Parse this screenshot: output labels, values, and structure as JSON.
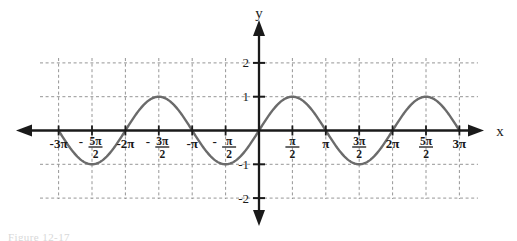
{
  "figure": {
    "caption": "Figure 12-17",
    "background_color": "#ffffff",
    "curve_color": "#6b6b6b",
    "axis_color": "#1a1a1a",
    "grid_color": "#8a8a8a"
  },
  "axes": {
    "x_axis_label": "x",
    "y_axis_label": "y",
    "y_ticks": [
      {
        "value": 2,
        "label": "2"
      },
      {
        "value": 1,
        "label": "1"
      },
      {
        "value": -1,
        "label": "-1"
      },
      {
        "value": -2,
        "label": "-2"
      }
    ],
    "x_ticks": [
      {
        "value": -9.42477796,
        "label": "-3π",
        "type": "plain",
        "multiple_of_pi": "-3"
      },
      {
        "value": -7.85398163,
        "label": "-5π/2",
        "type": "fraction",
        "sign": "-",
        "numerator": "5π",
        "denominator": "2"
      },
      {
        "value": -6.28318531,
        "label": "-2π",
        "type": "plain",
        "multiple_of_pi": "-2"
      },
      {
        "value": -4.71238898,
        "label": "-3π/2",
        "type": "fraction",
        "sign": "-",
        "numerator": "3π",
        "denominator": "2"
      },
      {
        "value": -3.14159265,
        "label": "-π",
        "type": "plain",
        "multiple_of_pi": "-1"
      },
      {
        "value": -1.57079633,
        "label": "-π/2",
        "type": "fraction",
        "sign": "-",
        "numerator": "π",
        "denominator": "2"
      },
      {
        "value": 1.57079633,
        "label": "π/2",
        "type": "fraction",
        "sign": "",
        "numerator": "π",
        "denominator": "2"
      },
      {
        "value": 3.14159265,
        "label": "π",
        "type": "plain",
        "multiple_of_pi": "1"
      },
      {
        "value": 4.71238898,
        "label": "3π/2",
        "type": "fraction",
        "sign": "",
        "numerator": "3π",
        "denominator": "2"
      },
      {
        "value": 6.28318531,
        "label": "2π",
        "type": "plain",
        "multiple_of_pi": "2"
      },
      {
        "value": 7.85398163,
        "label": "5π/2",
        "type": "fraction",
        "sign": "",
        "numerator": "5π",
        "denominator": "2"
      },
      {
        "value": 9.42477796,
        "label": "3π",
        "type": "plain",
        "multiple_of_pi": "3"
      }
    ]
  },
  "chart_data": {
    "type": "line",
    "title": "",
    "subtitle": "",
    "xlabel": "x",
    "ylabel": "y",
    "xlim": [
      -10.9955743,
      10.9955743
    ],
    "ylim": [
      -2.55,
      2.55
    ],
    "grid": true,
    "grid_style": "dashed",
    "legend": null,
    "legend_position": "none",
    "annotations": [],
    "series": [
      {
        "name": "y = sin(x)",
        "function": "sin(x)",
        "amplitude": 1,
        "period": 6.28318531,
        "phase_shift": 0,
        "vertical_shift": 0,
        "color": "#6b6b6b",
        "line_width": 2.4,
        "x_domain": [
          -9.42477796,
          9.42477796
        ],
        "key_points": [
          {
            "x": -9.42477796,
            "y": 0,
            "kind": "zero",
            "x_label": "-3π"
          },
          {
            "x": -7.85398163,
            "y": -1,
            "kind": "minimum",
            "x_label": "-5π/2"
          },
          {
            "x": -6.28318531,
            "y": 0,
            "kind": "zero",
            "x_label": "-2π"
          },
          {
            "x": -4.71238898,
            "y": 1,
            "kind": "maximum",
            "x_label": "-3π/2"
          },
          {
            "x": -3.14159265,
            "y": 0,
            "kind": "zero",
            "x_label": "-π"
          },
          {
            "x": -1.57079633,
            "y": -1,
            "kind": "minimum",
            "x_label": "-π/2"
          },
          {
            "x": 0,
            "y": 0,
            "kind": "zero",
            "x_label": "0"
          },
          {
            "x": 1.57079633,
            "y": 1,
            "kind": "maximum",
            "x_label": "π/2"
          },
          {
            "x": 3.14159265,
            "y": 0,
            "kind": "zero",
            "x_label": "π"
          },
          {
            "x": 4.71238898,
            "y": -1,
            "kind": "minimum",
            "x_label": "3π/2"
          },
          {
            "x": 6.28318531,
            "y": 0,
            "kind": "zero",
            "x_label": "2π"
          },
          {
            "x": 7.85398163,
            "y": 1,
            "kind": "maximum",
            "x_label": "5π/2"
          },
          {
            "x": 9.42477796,
            "y": 0,
            "kind": "zero",
            "x_label": "3π"
          }
        ]
      }
    ]
  },
  "geometry": {
    "origin_x_px": 259,
    "origin_y_px": 130.5,
    "px_per_half_pi": 33.4,
    "px_per_unit_y": 33.8,
    "x_axis_left_px": 18,
    "x_axis_right_px": 482,
    "y_axis_top_px": 22,
    "y_axis_bottom_px": 224
  }
}
